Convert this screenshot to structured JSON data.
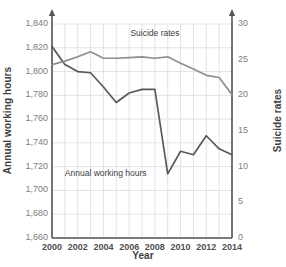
{
  "chart_data": {
    "type": "line",
    "title": "",
    "xlabel": "Year",
    "x": [
      2000,
      2001,
      2002,
      2003,
      2004,
      2005,
      2006,
      2007,
      2008,
      2009,
      2010,
      2011,
      2012,
      2013,
      2014
    ],
    "xticks": [
      "2000",
      "2002",
      "2004",
      "2006",
      "2008",
      "2010",
      "2012",
      "2014"
    ],
    "grid": true,
    "legend_position": "inline-annotations",
    "axes": [
      {
        "id": "left",
        "label": "Annual working hours",
        "ylim": [
          1660,
          1840
        ],
        "ticks": [
          "1,660",
          "1,680",
          "1,700",
          "1,720",
          "1,740",
          "1,760",
          "1,780",
          "1,800",
          "1,820",
          "1,840"
        ],
        "tick_values": [
          1660,
          1680,
          1700,
          1720,
          1740,
          1760,
          1780,
          1800,
          1820,
          1840
        ]
      },
      {
        "id": "right",
        "label": "Suicide rates",
        "ylim": [
          0,
          30
        ],
        "ticks": [
          "0",
          "5",
          "10",
          "15",
          "20",
          "25",
          "30"
        ],
        "tick_values": [
          0,
          5,
          10,
          15,
          20,
          25,
          30
        ]
      }
    ],
    "series": [
      {
        "name": "Annual working hours",
        "axis": "left",
        "color": "#595959",
        "annotation": "Annual working hours",
        "values": [
          1821,
          1806,
          1800,
          1799,
          1787,
          1774,
          1782,
          1785,
          1785,
          1714,
          1733,
          1730,
          1746,
          1735,
          1730
        ]
      },
      {
        "name": "Suicide rates",
        "axis": "right",
        "color": "#8f8f8f",
        "annotation": "Suicide rates",
        "values": [
          24.3,
          24.8,
          25.4,
          26.1,
          25.2,
          25.2,
          25.3,
          25.4,
          25.2,
          25.4,
          24.5,
          23.7,
          22.8,
          22.5,
          20.1
        ]
      }
    ]
  },
  "annotations": {
    "suicide_label": "Suicide rates",
    "working_hours_label": "Annual working hours"
  }
}
